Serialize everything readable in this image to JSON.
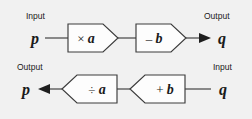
{
  "diagram": {
    "background_color": "#f1f1f1",
    "shape_fill": "#fdfdfd",
    "stroke_color": "#3c3c3c",
    "text_color": "#1a1a1a",
    "rows": [
      {
        "id": "forward-row",
        "direction": "left-to-right",
        "start_label": "Input",
        "start_variable": "p",
        "end_label": "Output",
        "end_variable": "q",
        "machines": [
          {
            "id": "multiply-machine",
            "operator": "×",
            "operand": "a"
          },
          {
            "id": "subtract-machine",
            "operator": "–",
            "operand": "b"
          }
        ]
      },
      {
        "id": "inverse-row",
        "direction": "right-to-left",
        "start_label": "Input",
        "start_variable": "q",
        "end_label": "Output",
        "end_variable": "p",
        "machines": [
          {
            "id": "divide-machine",
            "operator": "÷",
            "operand": "a"
          },
          {
            "id": "add-machine",
            "operator": "+",
            "operand": "b"
          }
        ]
      }
    ]
  }
}
